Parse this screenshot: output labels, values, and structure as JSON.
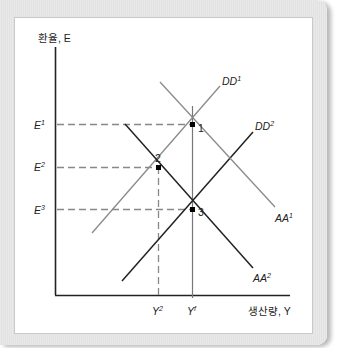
{
  "figure": {
    "y_axis_label": "환율, E",
    "x_axis_label": "생산량, Y",
    "y_ticks": [
      {
        "name": "E",
        "sup": "1"
      },
      {
        "name": "E",
        "sup": "2"
      },
      {
        "name": "E",
        "sup": "3"
      }
    ],
    "x_ticks": [
      {
        "name": "Y",
        "sup": "2"
      },
      {
        "name": "Y",
        "sup": "f"
      }
    ],
    "curves": [
      {
        "name": "DD",
        "sup": "1",
        "color": "#8a8a8a"
      },
      {
        "name": "DD",
        "sup": "2",
        "color": "#222222"
      },
      {
        "name": "AA",
        "sup": "1",
        "color": "#8a8a8a"
      },
      {
        "name": "AA",
        "sup": "2",
        "color": "#222222"
      }
    ],
    "points": [
      {
        "label": "1"
      },
      {
        "label": "2"
      },
      {
        "label": "3"
      }
    ],
    "colors": {
      "axis": "#222222",
      "dashed": "#888888",
      "frame": "#e6e6e6",
      "panel": "#ffffff"
    }
  }
}
